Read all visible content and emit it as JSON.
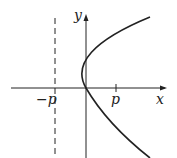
{
  "figure": {
    "axes": {
      "x_label": "x",
      "y_label": "y"
    },
    "ticks": {
      "neg_p": "−p",
      "p": "p"
    },
    "directrix_style": "dashed",
    "curve": "x = y^2/(4p), opening right",
    "colors": {
      "line": "#222222",
      "background": "#ffffff"
    }
  }
}
